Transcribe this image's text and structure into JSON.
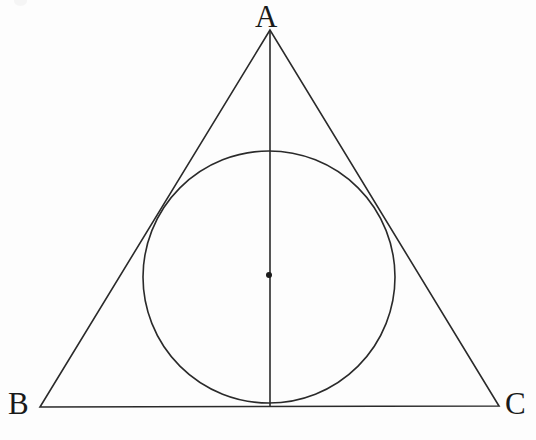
{
  "figure": {
    "background_color": "#fdfdfd",
    "stroke_color": "#2a2a2a",
    "stroke_width": 1.6,
    "labels": {
      "vertex_a": "A",
      "vertex_b": "B",
      "vertex_c": "C"
    },
    "geometry": {
      "triangle": {
        "name": "triangle-ABC",
        "vertices": [
          {
            "name": "A",
            "x": 270,
            "y": 30
          },
          {
            "name": "B",
            "x": 40,
            "y": 407
          },
          {
            "name": "C",
            "x": 499,
            "y": 406
          }
        ],
        "points_string": "270,30 40,407 499,406"
      },
      "incircle": {
        "name": "inscribed-circle",
        "center_x": 269,
        "center_y": 277,
        "radius": 126
      },
      "incenter_point": {
        "name": "incenter",
        "x": 269,
        "y": 275,
        "radius": 3
      },
      "altitude": {
        "name": "altitude-from-A",
        "x1": 270,
        "y1": 30,
        "x2": 270,
        "y2": 406
      },
      "tangent_points": [
        {
          "name": "tangency-AB",
          "x": 155,
          "y": 210
        },
        {
          "name": "tangency-AC",
          "x": 383,
          "y": 212
        },
        {
          "name": "tangency-BC",
          "x": 270,
          "y": 403
        }
      ]
    }
  }
}
